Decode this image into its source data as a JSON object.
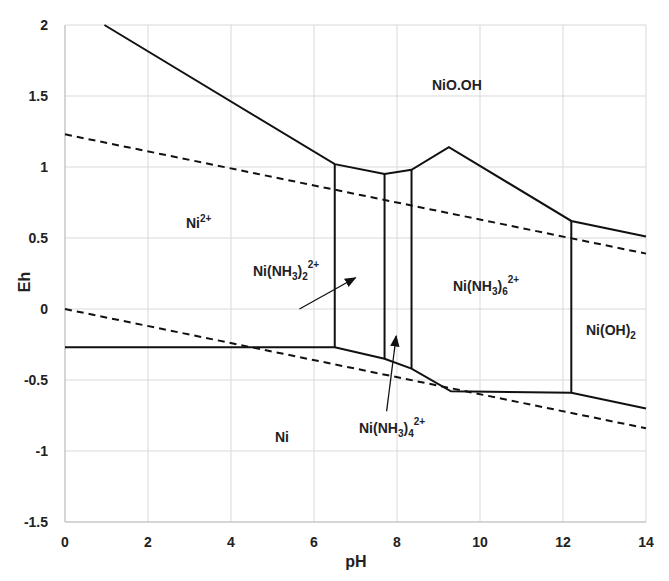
{
  "chart_data": {
    "type": "line",
    "title": "",
    "xlabel": "pH",
    "ylabel": "Eh",
    "xlim": [
      0,
      14
    ],
    "ylim": [
      -1.5,
      2
    ],
    "x_ticks": [
      0,
      2,
      4,
      6,
      8,
      10,
      12,
      14
    ],
    "y_ticks": [
      -1.5,
      -1,
      -0.5,
      0,
      0.5,
      1,
      1.5,
      2
    ],
    "x_tick_labels": [
      "0",
      "2",
      "4",
      "6",
      "8",
      "10",
      "12",
      "14"
    ],
    "y_tick_labels": [
      "-1.5",
      "-1",
      "-0.5",
      "0",
      "0.5",
      "1",
      "1.5",
      "2"
    ],
    "grid": true,
    "legend": null,
    "series": [
      {
        "name": "upper boundary",
        "style": "solid",
        "x": [
          0.95,
          6.5,
          7.7,
          8.35,
          9.25,
          12.2,
          14
        ],
        "y": [
          2.0,
          1.02,
          0.95,
          0.98,
          1.14,
          0.62,
          0.51
        ]
      },
      {
        "name": "lower boundary",
        "style": "solid",
        "x": [
          0,
          6.5,
          7.7,
          8.35,
          9.3,
          12.2,
          14
        ],
        "y": [
          -0.27,
          -0.27,
          -0.35,
          -0.42,
          -0.58,
          -0.59,
          -0.7
        ]
      },
      {
        "name": "boundary pH 6.5",
        "style": "solid",
        "x": [
          6.5,
          6.5
        ],
        "y": [
          -0.27,
          1.02
        ]
      },
      {
        "name": "boundary pH 7.7",
        "style": "solid",
        "x": [
          7.7,
          7.7
        ],
        "y": [
          -0.35,
          0.95
        ]
      },
      {
        "name": "boundary pH 8.35",
        "style": "solid",
        "x": [
          8.35,
          8.35
        ],
        "y": [
          -0.42,
          0.98
        ]
      },
      {
        "name": "boundary pH 12.2",
        "style": "solid",
        "x": [
          12.2,
          12.2
        ],
        "y": [
          -0.59,
          0.62
        ]
      },
      {
        "name": "O2/H2O line",
        "style": "dashed",
        "x": [
          0,
          14
        ],
        "y": [
          1.23,
          0.39
        ]
      },
      {
        "name": "H2O/H2 line",
        "style": "dashed",
        "x": [
          0,
          14
        ],
        "y": [
          0.0,
          -0.84
        ]
      }
    ],
    "annotations": [
      {
        "text": "NiO.OH",
        "x": 8.8,
        "y": 1.55
      },
      {
        "text": "Ni2+",
        "base": "Ni",
        "sup": "2+",
        "x": 2.9,
        "y": 0.6
      },
      {
        "text": "Ni(NH3)2 2+",
        "base": "Ni(NH",
        "sub1": "3",
        "mid": ")",
        "sub2": "2",
        "sup": "2+",
        "x": 4.5,
        "y": 0.2,
        "arrow_to": [
          7.0,
          0.22
        ]
      },
      {
        "text": "Ni(NH3)6 2+",
        "base": "Ni(NH",
        "sub1": "3",
        "mid": ")",
        "sub2": "6",
        "sup": "2+",
        "x": 9.2,
        "y": 0.16
      },
      {
        "text": "Ni(OH)2",
        "base": "Ni(OH)",
        "sub1": "2",
        "x": 12.4,
        "y": -0.2
      },
      {
        "text": "Ni(NH3)4 2+",
        "base": "Ni(NH",
        "sub1": "3",
        "mid": ")",
        "sub2": "4",
        "sup": "2+",
        "x": 7.0,
        "y": -0.83,
        "arrow_to": [
          7.98,
          -0.19
        ]
      },
      {
        "text": "Ni",
        "x": 5.0,
        "y": -0.93
      }
    ]
  },
  "labels": {
    "xlabel": "pH",
    "ylabel": "Eh",
    "region_nioh": "NiO.OH",
    "region_ni2_base": "Ni",
    "region_ni2_sup": "2+",
    "region_ni": "Ni",
    "region_nioh2_base": "Ni(OH)",
    "region_nioh2_sub": "2",
    "amm_base": "Ni(NH",
    "amm_sub3": "3",
    "amm_close": ")",
    "amm2_sub": "2",
    "amm4_sub": "4",
    "amm6_sub": "6",
    "charge": "2+"
  },
  "colors": {
    "line": "#111111",
    "grid": "#d9d9d9",
    "axis": "#bfbfbf",
    "text": "#222222"
  }
}
